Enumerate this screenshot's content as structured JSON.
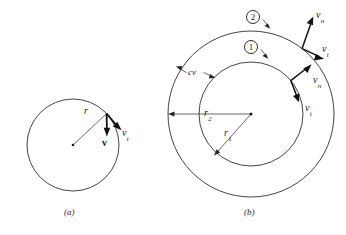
{
  "figure": {
    "background_color": "#ffffff",
    "line_color": "#262626",
    "arrow_color": "#111111"
  },
  "panel_a": {
    "caption": "(a)",
    "radius_label": "r",
    "vectors": [
      {
        "name": "velocity-vector",
        "label": "v",
        "style": "bold",
        "direction": "downward"
      },
      {
        "name": "tangential-velocity-vector",
        "label": "v",
        "subscript": "t",
        "style": "italic",
        "direction": "down-right-tangent"
      }
    ],
    "circle": {
      "center_x": 73,
      "center_y": 145,
      "radius": 46
    }
  },
  "panel_b": {
    "caption": "(b)",
    "control_volume_label": "cv",
    "station_badges": [
      {
        "name": "station-2-badge",
        "label": "2"
      },
      {
        "name": "station-1-badge",
        "label": "1"
      }
    ],
    "radius_labels": [
      {
        "name": "outer-radius-label",
        "label": "r",
        "subscript": "2"
      },
      {
        "name": "inner-radius-label",
        "label": "r",
        "subscript": "1"
      }
    ],
    "vectors": [
      {
        "name": "outer-normal-velocity",
        "label": "v",
        "subscript": "n"
      },
      {
        "name": "outer-tangential-velocity",
        "label": "v",
        "subscript": "t"
      },
      {
        "name": "inner-normal-velocity",
        "label": "v",
        "subscript": "n"
      },
      {
        "name": "inner-tangential-velocity",
        "label": "v",
        "subscript": "t"
      }
    ],
    "circles": {
      "outer": {
        "center_x": 251,
        "center_y": 114,
        "radius": 83
      },
      "inner": {
        "center_x": 251,
        "center_y": 114,
        "radius": 52
      }
    }
  }
}
